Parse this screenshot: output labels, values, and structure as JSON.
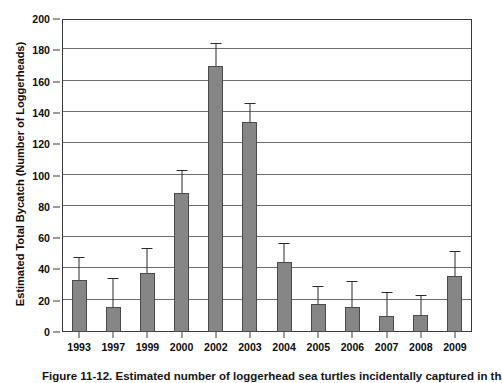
{
  "chart_data": {
    "type": "bar",
    "title": "",
    "xlabel": "",
    "ylabel": "Estimated Total Bycatch (Number of Loggerheads)",
    "ylim": [
      0,
      200
    ],
    "yticks": [
      0,
      20,
      40,
      60,
      80,
      100,
      120,
      140,
      160,
      180,
      200
    ],
    "ytick_labels": [
      "0",
      "20",
      "40",
      "60",
      "80",
      "100",
      "120",
      "140",
      "160",
      "180",
      "200"
    ],
    "grid": true,
    "legend": "none",
    "categories": [
      "1993",
      "1997",
      "1999",
      "2000",
      "2002",
      "2003",
      "2004",
      "2005",
      "2006",
      "2007",
      "2008",
      "2009"
    ],
    "values": [
      33,
      16,
      38,
      89,
      170,
      134,
      45,
      18,
      16,
      10,
      11,
      36
    ],
    "error_upper": [
      47,
      34,
      53,
      103,
      184,
      146,
      56,
      29,
      32,
      25,
      23,
      51
    ],
    "bar_color": "#868686",
    "bar_edge_color": "#4a4a4a",
    "error_color": "#2b2b2b",
    "axis_color": "#3a3a3a",
    "grid_color": "#6e6e6e"
  },
  "caption": {
    "text": "Figure 11-12.  Estimated number of loggerhead sea turtles incidentally captured in the U.S."
  }
}
